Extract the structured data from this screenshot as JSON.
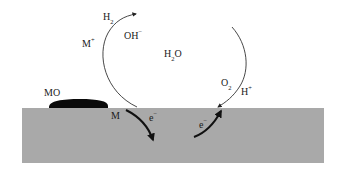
{
  "diagram": {
    "substrate": {
      "label": "metal substrate",
      "color": "#a9a9a9"
    },
    "oxide": {
      "label": "MO",
      "color": "#0a0a0a"
    },
    "labels": {
      "h2": {
        "base": "H",
        "sub": "2"
      },
      "m_plus": {
        "base": "M",
        "sup": "+"
      },
      "oh_minus": {
        "base": "OH",
        "sup": "−"
      },
      "h2o": {
        "base": "H",
        "sub": "2",
        "tail": "O"
      },
      "o2": {
        "base": "O",
        "sub": "2"
      },
      "h_plus": {
        "base": "H",
        "sup": "+"
      },
      "mo": "MO",
      "m": "M",
      "e_left": {
        "base": "e",
        "sup": "−"
      },
      "e_right": {
        "base": "e",
        "sup": "−"
      }
    },
    "arrows": [
      {
        "name": "anodic-cycle-arrow",
        "from": "M",
        "to": "H2",
        "direction": "up"
      },
      {
        "name": "cathodic-cycle-arrow",
        "from": "O2",
        "to": "surface",
        "direction": "down"
      },
      {
        "name": "electron-in-arrow",
        "label": "e−",
        "direction": "into-metal"
      },
      {
        "name": "electron-out-arrow",
        "label": "e−",
        "direction": "out-of-metal"
      }
    ],
    "colors": {
      "line": "#333333",
      "background": "#ffffff"
    }
  }
}
